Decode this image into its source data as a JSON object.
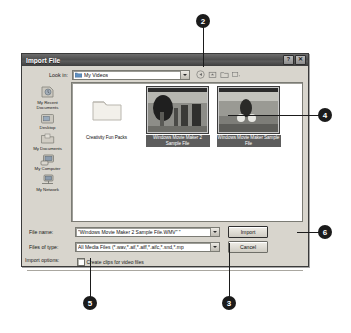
{
  "dialog": {
    "title": "Import File",
    "titlebar_buttons": [
      {
        "name": "help",
        "glyph": "?"
      },
      {
        "name": "close",
        "glyph": "✕"
      }
    ],
    "lookin": {
      "label": "Look in:",
      "value": "My Videos"
    },
    "toolbar_icons": [
      "back-icon",
      "up-one-level-icon",
      "new-folder-icon",
      "views-icon"
    ],
    "places": [
      {
        "label": "My Recent\nDocuments",
        "line1": "My Recent",
        "line2": "Documents",
        "icon": "recent-documents-icon"
      },
      {
        "label": "Desktop",
        "line1": "Desktop",
        "line2": "",
        "icon": "desktop-icon"
      },
      {
        "label": "My Documents",
        "line1": "My Documents",
        "line2": "",
        "icon": "my-documents-icon"
      },
      {
        "label": "My Computer",
        "line1": "My Computer",
        "line2": "",
        "icon": "my-computer-icon"
      },
      {
        "label": "My Network",
        "line1": "My Network",
        "line2": "",
        "icon": "my-network-icon"
      }
    ],
    "files": [
      {
        "name": "Creativity Fun Packs",
        "type": "folder",
        "selected": false
      },
      {
        "name": "Windows Movie Maker 2 Sample File",
        "type": "video",
        "selected": true
      },
      {
        "name": "Windows Movie Maker Sample File",
        "type": "video",
        "selected": true
      }
    ],
    "filename": {
      "label": "File name:",
      "value": "\"Windows Movie Maker 2 Sample File.WMV\" \""
    },
    "filetype": {
      "label": "Files of type:",
      "value": "All Media Files (*.wav,*.aif,*.aiff,*.aifc,*.snd,*.mp"
    },
    "buttons": {
      "import": "Import",
      "cancel": "Cancel"
    },
    "checkbox": {
      "label": "Create clips for video files",
      "checked": false
    },
    "import_options_label": "Import options:"
  },
  "callouts": [
    {
      "number": "2",
      "target": "lookin-dropdown-arrow"
    },
    {
      "number": "4",
      "target": "selected-video-thumbnail"
    },
    {
      "number": "6",
      "target": "import-button"
    },
    {
      "number": "3",
      "target": "files-of-type-dropdown"
    },
    {
      "number": "5",
      "target": "create-clips-checkbox"
    }
  ]
}
